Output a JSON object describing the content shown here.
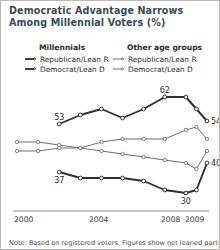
{
  "title": "Democratic Advantage Narrows Among Millennial Voters (%)",
  "legend": {
    "groups": [
      {
        "heading": "Millennials",
        "weight": "thick",
        "entries": [
          {
            "label": "Republican/Lean R",
            "marker": "line-circle-marker"
          },
          {
            "label": "Democrat/Lean D",
            "marker": "line-circle-marker"
          }
        ]
      },
      {
        "heading": "Other age groups",
        "weight": "thin",
        "entries": [
          {
            "label": "Republican/Lean R",
            "marker": "line-circle-marker"
          },
          {
            "label": "Democrat/Lean D",
            "marker": "line-circle-marker"
          }
        ]
      }
    ]
  },
  "axis": {
    "xticks": [
      "2000",
      "2004",
      "2008",
      "2009"
    ]
  },
  "note": "Note: Based on registered voters. Figures show net leaned party",
  "chart_data": {
    "type": "line",
    "title": "Democratic Advantage Narrows Among Millennial Voters (%)",
    "xlabel": "",
    "ylabel": "",
    "xlim": [
      2000,
      2009
    ],
    "ylim": [
      26,
      68
    ],
    "grid": false,
    "legend_position": "top",
    "xtick_values": [
      2000,
      2004,
      2008,
      2009
    ],
    "xtick_labels": [
      "2000",
      "2004",
      "2008",
      "2009"
    ],
    "series": [
      {
        "name": "Millennials Democrat/Lean D",
        "style": "thick",
        "color": "#2f2f2f",
        "x": [
          2002,
          2003,
          2004,
          2005,
          2006,
          2007,
          2008,
          2008.5,
          2009
        ],
        "values": [
          53,
          56,
          58,
          55,
          58,
          62,
          62,
          58,
          54
        ],
        "point_labels": [
          {
            "x": 2002,
            "value": 53,
            "text": "53"
          },
          {
            "x": 2007,
            "value": 62,
            "text": "62"
          },
          {
            "x": 2009,
            "value": 54,
            "text": "54"
          }
        ]
      },
      {
        "name": "Millennials Republican/Lean R",
        "style": "thick",
        "color": "#2f2f2f",
        "x": [
          2002,
          2003,
          2004,
          2005,
          2006,
          2007,
          2008,
          2008.5,
          2009
        ],
        "values": [
          37,
          35,
          35,
          35,
          34,
          31,
          30,
          31,
          40
        ],
        "point_labels": [
          {
            "x": 2002,
            "value": 37,
            "text": "37"
          },
          {
            "x": 2008,
            "value": 30,
            "text": "30"
          },
          {
            "x": 2009,
            "value": 40,
            "text": "40"
          }
        ]
      },
      {
        "name": "Other age groups Democrat/Lean D",
        "style": "thin",
        "color": "#6d6d6d",
        "x": [
          2000,
          2001,
          2002,
          2003,
          2004,
          2005,
          2006,
          2007,
          2008,
          2008.5,
          2009
        ],
        "values": [
          44,
          44,
          45,
          45,
          47,
          48,
          48,
          48,
          51,
          52,
          48
        ],
        "point_labels": []
      },
      {
        "name": "Other age groups Republican/Lean R",
        "style": "thin",
        "color": "#6d6d6d",
        "x": [
          2000,
          2001,
          2002,
          2003,
          2004,
          2005,
          2006,
          2007,
          2008,
          2008.5,
          2009
        ],
        "values": [
          47,
          47,
          46,
          45,
          44,
          43,
          42,
          41,
          40,
          38,
          44
        ],
        "point_labels": []
      }
    ]
  }
}
